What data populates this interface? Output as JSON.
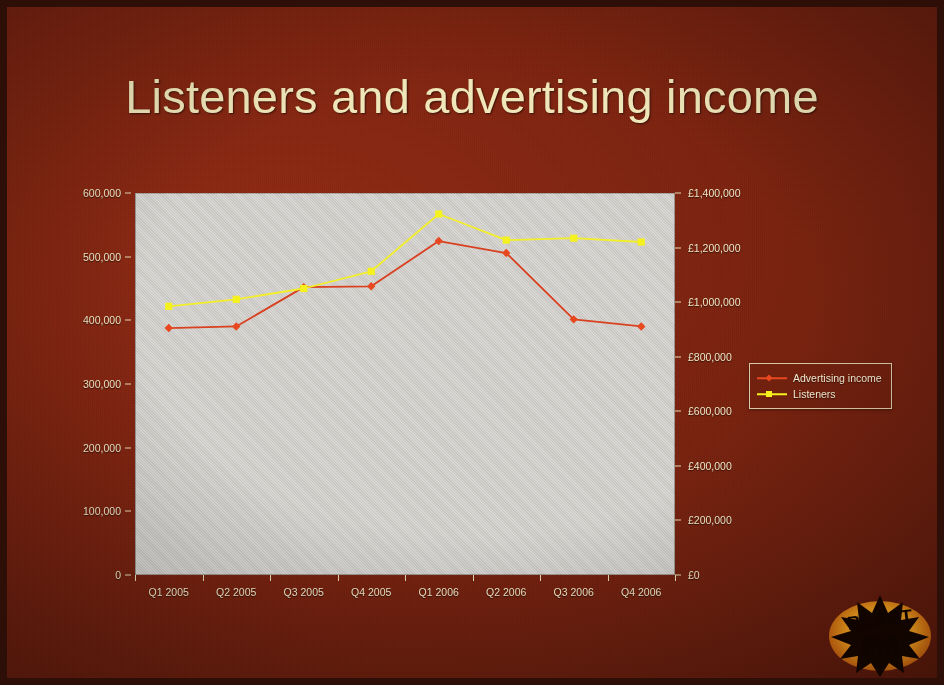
{
  "slide": {
    "title": "Listeners and advertising income",
    "background_color": "#7d2411",
    "title_color": "#efe6b9",
    "plot_background_color": "#cfcdc9"
  },
  "logo": {
    "line1": "BLAST",
    "line2": "FM",
    "name": "blast-fm-logo",
    "colors": {
      "glow": "#f7a01e",
      "star": "#1a0700",
      "text": "#120500"
    }
  },
  "chart_data": {
    "type": "line",
    "title": "Listeners and advertising income",
    "xlabel": "",
    "grid": false,
    "legend_position": "right",
    "categories": [
      "Q1 2005",
      "Q2 2005",
      "Q3 2005",
      "Q4 2005",
      "Q1 2006",
      "Q2 2006",
      "Q3 2006",
      "Q4 2006"
    ],
    "axes": {
      "left": {
        "label": "Listeners",
        "min": 0,
        "max": 600000,
        "step": 100000,
        "ticks": [
          "0",
          "100,000",
          "200,000",
          "300,000",
          "400,000",
          "500,000",
          "600,000"
        ],
        "tick_values": [
          0,
          100000,
          200000,
          300000,
          400000,
          500000,
          600000
        ]
      },
      "right": {
        "label": "Advertising income",
        "min": 0,
        "max": 1400000,
        "step": 200000,
        "ticks": [
          "£0",
          "£200,000",
          "£400,000",
          "£600,000",
          "£800,000",
          "£1,000,000",
          "£1,200,000",
          "£1,400,000"
        ],
        "tick_values": [
          0,
          200000,
          400000,
          600000,
          800000,
          1000000,
          1200000,
          1400000
        ]
      }
    },
    "series": [
      {
        "name": "Advertising income",
        "axis": "right",
        "color": "#d9401f",
        "marker": "diamond",
        "marker_color": "#e8481f",
        "values": [
          905000,
          911000,
          1055000,
          1058000,
          1224000,
          1180000,
          937000,
          911000
        ]
      },
      {
        "name": "Listeners",
        "axis": "left",
        "color": "#f2ee2a",
        "marker": "square",
        "marker_color": "#f5f11e",
        "values": [
          422000,
          433000,
          450000,
          477000,
          567000,
          526000,
          529000,
          523000
        ]
      }
    ],
    "legend": [
      {
        "label": "Advertising income",
        "color": "#e8481f",
        "marker": "diamond"
      },
      {
        "label": "Listeners",
        "color": "#f5f11e",
        "marker": "square"
      }
    ]
  }
}
